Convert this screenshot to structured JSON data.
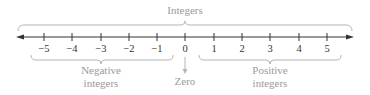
{
  "title": "Integers",
  "number_line": {
    "ticks": [
      {
        "value": -5,
        "label": "−5",
        "x": 44
      },
      {
        "value": -4,
        "label": "−4",
        "x": 72
      },
      {
        "value": -3,
        "label": "−3",
        "x": 101
      },
      {
        "value": -2,
        "label": "−2",
        "x": 129
      },
      {
        "value": -1,
        "label": "−1",
        "x": 157
      },
      {
        "value": 0,
        "label": "0",
        "x": 185
      },
      {
        "value": 1,
        "label": "1",
        "x": 214
      },
      {
        "value": 2,
        "label": "2",
        "x": 242
      },
      {
        "value": 3,
        "label": "3",
        "x": 270
      },
      {
        "value": 4,
        "label": "4",
        "x": 299
      },
      {
        "value": 5,
        "label": "5",
        "x": 327
      }
    ],
    "line_color": "#333333"
  },
  "groups": {
    "all": {
      "label": "Integers"
    },
    "negative": {
      "line1": "Negative",
      "line2": "integers"
    },
    "zero": {
      "label": "Zero"
    },
    "positive": {
      "line1": "Positive",
      "line2": "integers"
    }
  },
  "colors": {
    "label": "#9a9a9a",
    "brace": "#b5b5b5",
    "axis": "#333333"
  }
}
